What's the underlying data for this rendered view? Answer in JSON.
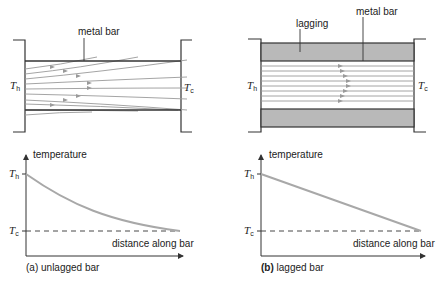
{
  "colors": {
    "ink": "#333333",
    "flow_line": "#9a9a9a",
    "curve": "#a8a8a8",
    "lagging_fill": "#b9b9b9"
  },
  "panel_a": {
    "caption_prefix": "(a)",
    "caption": "unlagged bar",
    "bar_label": "metal bar",
    "hot_symbol": "T",
    "hot_subscript": "h",
    "cold_symbol": "T",
    "cold_subscript": "c",
    "graph": {
      "y_axis_label": "temperature",
      "x_axis_label": "distance along bar",
      "tick_high_symbol": "T",
      "tick_high_subscript": "h",
      "tick_low_symbol": "T",
      "tick_low_subscript": "c"
    }
  },
  "panel_b": {
    "caption_prefix": "(b)",
    "caption": "lagged bar",
    "bar_label": "metal bar",
    "lagging_label": "lagging",
    "hot_symbol": "T",
    "hot_subscript": "h",
    "cold_symbol": "T",
    "cold_subscript": "c",
    "graph": {
      "y_axis_label": "temperature",
      "x_axis_label": "distance along bar",
      "tick_high_symbol": "T",
      "tick_high_subscript": "h",
      "tick_low_symbol": "T",
      "tick_low_subscript": "c"
    }
  }
}
